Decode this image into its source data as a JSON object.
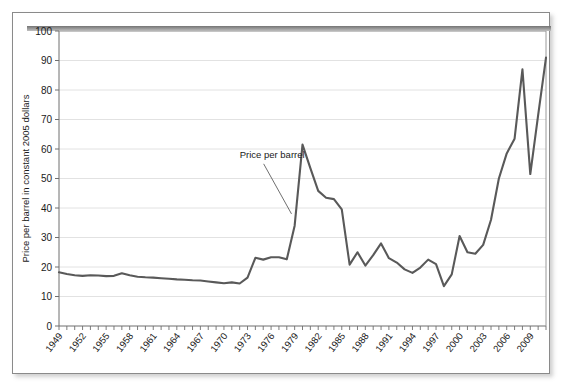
{
  "chart_data": {
    "type": "line",
    "title": "",
    "xlabel": "",
    "ylabel": "Price per barrel in constant 2005 dollars",
    "ylim": [
      0,
      100
    ],
    "ytick_values": [
      0,
      10,
      20,
      30,
      40,
      50,
      60,
      70,
      80,
      90,
      100
    ],
    "ytick_labels": [
      "0",
      "10",
      "20",
      "30",
      "40",
      "50",
      "60",
      "70",
      "80",
      "90",
      "100"
    ],
    "xlim": [
      1949,
      2011
    ],
    "xtick_labels": [
      "1949",
      "1952",
      "1955",
      "1958",
      "1961",
      "1964",
      "1967",
      "1970",
      "1973",
      "1976",
      "1979",
      "1982",
      "1985",
      "1988",
      "1991",
      "1994",
      "1997",
      "2000",
      "2003",
      "2006",
      "2009"
    ],
    "xtick_step_years": 3,
    "minor_ticks_every_year": true,
    "grid": "horizontal",
    "legend": "none",
    "annotations": [
      {
        "text": "Price per barrel",
        "label_x": 1972.0,
        "label_y": 57.0,
        "point_x": 1978.6,
        "point_y": 38.0
      }
    ],
    "series": [
      {
        "name": "Price per barrel",
        "color": "#595959",
        "x": [
          1949,
          1950,
          1951,
          1952,
          1953,
          1954,
          1955,
          1956,
          1957,
          1958,
          1959,
          1960,
          1961,
          1962,
          1963,
          1964,
          1965,
          1966,
          1967,
          1968,
          1969,
          1970,
          1971,
          1972,
          1973,
          1974,
          1975,
          1976,
          1977,
          1978,
          1979,
          1980,
          1981,
          1982,
          1983,
          1984,
          1985,
          1986,
          1987,
          1988,
          1989,
          1990,
          1991,
          1992,
          1993,
          1994,
          1995,
          1996,
          1997,
          1998,
          1999,
          2000,
          2001,
          2002,
          2003,
          2004,
          2005,
          2006,
          2007,
          2008,
          2009,
          2010,
          2011
        ],
        "values": [
          18.2,
          17.6,
          17.2,
          17.0,
          17.2,
          17.1,
          16.9,
          17.0,
          17.9,
          17.2,
          16.7,
          16.5,
          16.4,
          16.2,
          16.0,
          15.8,
          15.7,
          15.5,
          15.4,
          15.1,
          14.8,
          14.5,
          14.8,
          14.4,
          16.4,
          23.1,
          22.5,
          23.3,
          23.3,
          22.6,
          34.0,
          61.5,
          53.5,
          45.8,
          43.5,
          43.0,
          39.5,
          20.8,
          25.0,
          20.5,
          24.0,
          28.0,
          23.0,
          21.5,
          19.2,
          18.0,
          19.8,
          22.5,
          21.0,
          13.5,
          17.5,
          30.5,
          25.0,
          24.5,
          27.5,
          36.0,
          50.0,
          58.5,
          63.5,
          87.0,
          51.5,
          71.5,
          91.0
        ]
      }
    ]
  }
}
